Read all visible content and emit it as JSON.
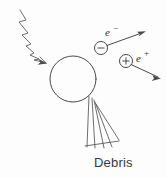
{
  "figure": {
    "background_color": "#fdfdfd",
    "line_color": "#4a4a4a",
    "width": 167,
    "height": 178
  },
  "labels": {
    "electron": {
      "symbol": "e",
      "sign": "−",
      "name": "electron-label"
    },
    "positron": {
      "symbol": "e",
      "sign": "+",
      "name": "positron-label"
    },
    "debris": "Debris"
  },
  "elements": {
    "incoming_photon": {
      "name": "wavy-photon-arrow",
      "description": "wavy incident ray arrow from upper left"
    },
    "target": {
      "name": "target-sphere",
      "description": "large open circle target",
      "center_x": 73,
      "center_y": 79,
      "radius": 23
    },
    "electron_track": {
      "name": "electron-track-arrow",
      "charge": "−",
      "circle_center_x": 101,
      "circle_center_y": 48,
      "circle_radius": 6.5,
      "arrow_tip_x": 146,
      "arrow_tip_y": 31
    },
    "positron_track": {
      "name": "positron-track-arrow",
      "charge": "+",
      "circle_center_x": 126,
      "circle_center_y": 61,
      "circle_radius": 6.5,
      "arrow_tip_x": 161,
      "arrow_tip_y": 79
    },
    "debris_fan": {
      "name": "debris-ray-fan",
      "ray_count": 5,
      "description": "fan of straight rays leaving the lower right of the sphere toward lower left"
    }
  }
}
